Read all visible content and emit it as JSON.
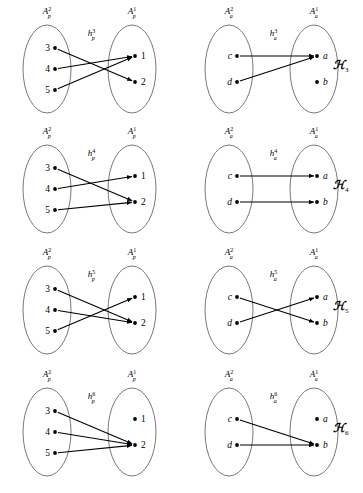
{
  "figure": {
    "rows": [
      {
        "id": "row-k3",
        "k_label": "ℋ",
        "k_sub": "3",
        "left": {
          "id": "panel-k3-p",
          "source_label": "A",
          "source_sup": "2",
          "source_sub": "p",
          "target_label": "A",
          "target_sup": "1",
          "target_sub": "p",
          "map_label": "h",
          "map_sup": "3",
          "map_sub": "p",
          "source_nodes": [
            "3",
            "4",
            "5"
          ],
          "target_nodes": [
            "1",
            "2"
          ],
          "edges": [
            {
              "from": "3",
              "to": "2"
            },
            {
              "from": "4",
              "to": "1"
            },
            {
              "from": "5",
              "to": "1"
            }
          ]
        },
        "right": {
          "id": "panel-k3-a",
          "source_label": "A",
          "source_sup": "2",
          "source_sub": "a",
          "target_label": "A",
          "target_sup": "1",
          "target_sub": "a",
          "map_label": "h",
          "map_sup": "3",
          "map_sub": "a",
          "source_nodes": [
            "c",
            "d"
          ],
          "target_nodes": [
            "a",
            "b"
          ],
          "edges": [
            {
              "from": "c",
              "to": "a"
            },
            {
              "from": "d",
              "to": "a"
            }
          ]
        }
      },
      {
        "id": "row-k4",
        "k_label": "ℋ",
        "k_sub": "4",
        "left": {
          "id": "panel-k4-p",
          "source_label": "A",
          "source_sup": "2",
          "source_sub": "p",
          "target_label": "A",
          "target_sup": "1",
          "target_sub": "p",
          "map_label": "h",
          "map_sup": "4",
          "map_sub": "p",
          "source_nodes": [
            "3",
            "4",
            "5"
          ],
          "target_nodes": [
            "1",
            "2"
          ],
          "edges": [
            {
              "from": "3",
              "to": "2"
            },
            {
              "from": "4",
              "to": "1"
            },
            {
              "from": "5",
              "to": "2"
            }
          ]
        },
        "right": {
          "id": "panel-k4-a",
          "source_label": "A",
          "source_sup": "2",
          "source_sub": "a",
          "target_label": "A",
          "target_sup": "1",
          "target_sub": "a",
          "map_label": "h",
          "map_sup": "4",
          "map_sub": "a",
          "source_nodes": [
            "c",
            "d"
          ],
          "target_nodes": [
            "a",
            "b"
          ],
          "edges": [
            {
              "from": "c",
              "to": "a"
            },
            {
              "from": "d",
              "to": "b"
            }
          ]
        }
      },
      {
        "id": "row-k5",
        "k_label": "ℋ",
        "k_sub": "5",
        "left": {
          "id": "panel-k5-p",
          "source_label": "A",
          "source_sup": "2",
          "source_sub": "p",
          "target_label": "A",
          "target_sup": "1",
          "target_sub": "p",
          "map_label": "h",
          "map_sup": "5",
          "map_sub": "p",
          "source_nodes": [
            "3",
            "4",
            "5"
          ],
          "target_nodes": [
            "1",
            "2"
          ],
          "edges": [
            {
              "from": "3",
              "to": "2"
            },
            {
              "from": "4",
              "to": "2"
            },
            {
              "from": "5",
              "to": "1"
            }
          ]
        },
        "right": {
          "id": "panel-k5-a",
          "source_label": "A",
          "source_sup": "2",
          "source_sub": "a",
          "target_label": "A",
          "target_sup": "1",
          "target_sub": "a",
          "map_label": "h",
          "map_sup": "5",
          "map_sub": "a",
          "source_nodes": [
            "c",
            "d"
          ],
          "target_nodes": [
            "a",
            "b"
          ],
          "edges": [
            {
              "from": "c",
              "to": "b"
            },
            {
              "from": "d",
              "to": "a"
            }
          ]
        }
      },
      {
        "id": "row-k6",
        "k_label": "ℋ",
        "k_sub": "6",
        "left": {
          "id": "panel-k6-p",
          "source_label": "A",
          "source_sup": "2",
          "source_sub": "p",
          "target_label": "A",
          "target_sup": "1",
          "target_sub": "p",
          "map_label": "h",
          "map_sup": "6",
          "map_sub": "p",
          "source_nodes": [
            "3",
            "4",
            "5"
          ],
          "target_nodes": [
            "1",
            "2"
          ],
          "edges": [
            {
              "from": "3",
              "to": "2"
            },
            {
              "from": "4",
              "to": "2"
            },
            {
              "from": "5",
              "to": "2"
            }
          ]
        },
        "right": {
          "id": "panel-k6-a",
          "source_label": "A",
          "source_sup": "2",
          "source_sub": "a",
          "target_label": "A",
          "target_sup": "1",
          "target_sub": "a",
          "map_label": "h",
          "map_sup": "6",
          "map_sub": "a",
          "source_nodes": [
            "c",
            "d"
          ],
          "target_nodes": [
            "a",
            "b"
          ],
          "edges": [
            {
              "from": "c",
              "to": "b"
            },
            {
              "from": "d",
              "to": "b"
            }
          ]
        }
      }
    ]
  }
}
